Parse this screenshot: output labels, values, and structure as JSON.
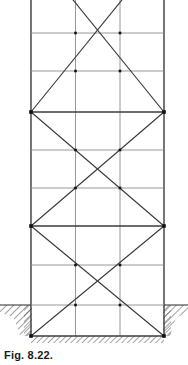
{
  "figure": {
    "caption": "Fig. 8.22.",
    "type": "engineering-line-drawing",
    "colors": {
      "line": "#3b3b3b",
      "light_line": "#8c8c8c",
      "node": "#111111",
      "hatch": "#4a4a4a",
      "background": "#ffffff",
      "caption": "#1a1a1a"
    },
    "geometry": {
      "canvas_width": 188,
      "canvas_height": 365,
      "columns_x": [
        31,
        75.5,
        120,
        164
      ],
      "outer_columns_x": [
        31,
        164
      ],
      "inner_columns_x": [
        75.5,
        120
      ],
      "column_top_y": 0,
      "column_base_y": 336,
      "ground_line_y": 305,
      "foundation_line_y": 336,
      "strut_levels_y": [
        33,
        71,
        112,
        150,
        188,
        226,
        265,
        305,
        336
      ],
      "panel_node_levels_y": [
        112,
        226,
        336
      ],
      "ground_hatch_left_span": [
        0,
        31
      ],
      "ground_hatch_right_span": [
        164,
        188
      ],
      "excavation_wall_x": [
        31,
        164
      ]
    },
    "members": {
      "verticals": [
        {
          "name": "left-outer-column",
          "x": 31,
          "y1": 0,
          "y2": 336,
          "weight": "heavy"
        },
        {
          "name": "left-inner-column",
          "x": 75.5,
          "y1": 0,
          "y2": 336,
          "weight": "light"
        },
        {
          "name": "right-inner-column",
          "x": 120,
          "y1": 0,
          "y2": 336,
          "weight": "light"
        },
        {
          "name": "right-outer-column",
          "x": 164,
          "y1": 0,
          "y2": 336,
          "weight": "heavy"
        }
      ],
      "horizontals": [
        {
          "name": "strut-level-1",
          "y": 33,
          "weight": "light"
        },
        {
          "name": "strut-level-2",
          "y": 71,
          "weight": "light"
        },
        {
          "name": "strut-level-3",
          "y": 112,
          "weight": "heavy"
        },
        {
          "name": "strut-level-4",
          "y": 150,
          "weight": "light"
        },
        {
          "name": "strut-level-5",
          "y": 188,
          "weight": "light"
        },
        {
          "name": "strut-level-6",
          "y": 226,
          "weight": "heavy"
        },
        {
          "name": "strut-level-7",
          "y": 265,
          "weight": "light"
        },
        {
          "name": "strut-level-8",
          "y": 305,
          "weight": "light"
        },
        {
          "name": "base-sill",
          "y": 336,
          "weight": "heavy"
        }
      ],
      "diagonals": [
        {
          "name": "panel-1-diagonal-a",
          "x1": 31,
          "y1": 112,
          "x2": 120,
          "y2": 0
        },
        {
          "name": "panel-1-diagonal-b",
          "x1": 164,
          "y1": 112,
          "x2": 75.5,
          "y2": 0
        },
        {
          "name": "panel-2-diagonal-a",
          "x1": 31,
          "y1": 112,
          "x2": 164,
          "y2": 226
        },
        {
          "name": "panel-2-diagonal-b",
          "x1": 164,
          "y1": 112,
          "x2": 31,
          "y2": 226
        },
        {
          "name": "panel-3-diagonal-a",
          "x1": 31,
          "y1": 226,
          "x2": 164,
          "y2": 336
        },
        {
          "name": "panel-3-diagonal-b",
          "x1": 164,
          "y1": 226,
          "x2": 31,
          "y2": 336
        }
      ],
      "nodes": [
        {
          "name": "node-left-mid-upper",
          "x": 31,
          "y": 112
        },
        {
          "name": "node-right-mid-upper",
          "x": 164,
          "y": 112
        },
        {
          "name": "node-left-mid-lower",
          "x": 31,
          "y": 226
        },
        {
          "name": "node-right-mid-lower",
          "x": 164,
          "y": 226
        },
        {
          "name": "node-left-base",
          "x": 31,
          "y": 336
        },
        {
          "name": "node-right-base",
          "x": 164,
          "y": 336
        },
        {
          "name": "node-inner-left-top",
          "x": 75.5,
          "y": 33
        },
        {
          "name": "node-inner-right-top",
          "x": 120,
          "y": 33
        },
        {
          "name": "node-inner-left-l2",
          "x": 75.5,
          "y": 71
        },
        {
          "name": "node-inner-right-l2",
          "x": 120,
          "y": 71
        },
        {
          "name": "node-inner-left-l4",
          "x": 75.5,
          "y": 150
        },
        {
          "name": "node-inner-right-l4",
          "x": 120,
          "y": 150
        },
        {
          "name": "node-inner-left-l5",
          "x": 75.5,
          "y": 188
        },
        {
          "name": "node-inner-right-l5",
          "x": 120,
          "y": 188
        },
        {
          "name": "node-inner-left-l7",
          "x": 75.5,
          "y": 265
        },
        {
          "name": "node-inner-right-l7",
          "x": 120,
          "y": 265
        },
        {
          "name": "node-inner-left-ground",
          "x": 75.5,
          "y": 305
        },
        {
          "name": "node-inner-right-ground",
          "x": 120,
          "y": 305
        }
      ]
    }
  }
}
